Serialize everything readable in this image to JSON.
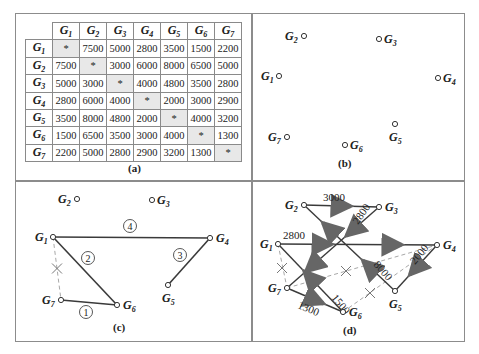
{
  "figure": {
    "panels": {
      "a": {
        "caption": "(a)"
      },
      "b": {
        "caption": "(b)"
      },
      "c": {
        "caption": "(c)"
      },
      "d": {
        "caption": "(d)"
      }
    }
  },
  "matrix": {
    "headers": [
      "G1",
      "G2",
      "G3",
      "G4",
      "G5",
      "G6",
      "G7"
    ],
    "diagonal_symbol": "*",
    "rows": [
      {
        "label": "G1",
        "cells": [
          "*",
          "7500",
          "5000",
          "2800",
          "3500",
          "1500",
          "2200"
        ]
      },
      {
        "label": "G2",
        "cells": [
          "7500",
          "*",
          "3000",
          "6000",
          "8000",
          "6500",
          "5000"
        ]
      },
      {
        "label": "G3",
        "cells": [
          "5000",
          "3000",
          "*",
          "4000",
          "4800",
          "3500",
          "2800"
        ]
      },
      {
        "label": "G4",
        "cells": [
          "2800",
          "6000",
          "4000",
          "*",
          "2000",
          "3000",
          "2900"
        ]
      },
      {
        "label": "G5",
        "cells": [
          "3500",
          "8000",
          "4800",
          "2000",
          "*",
          "4000",
          "3200"
        ]
      },
      {
        "label": "G6",
        "cells": [
          "1500",
          "6500",
          "3500",
          "3000",
          "4000",
          "*",
          "1300"
        ]
      },
      {
        "label": "G7",
        "cells": [
          "2200",
          "5000",
          "2800",
          "2900",
          "3200",
          "1300",
          "*"
        ]
      }
    ]
  },
  "panel_b": {
    "nodes": [
      {
        "id": "G1",
        "x": 279,
        "y": 76,
        "lx": -18,
        "ly": 4
      },
      {
        "id": "G2",
        "x": 304,
        "y": 36,
        "lx": -19,
        "ly": 4
      },
      {
        "id": "G3",
        "x": 379,
        "y": 39,
        "lx": 5,
        "ly": 4
      },
      {
        "id": "G4",
        "x": 438,
        "y": 78,
        "lx": 5,
        "ly": 4
      },
      {
        "id": "G5",
        "x": 395,
        "y": 124,
        "lx": -6,
        "ly": 17
      },
      {
        "id": "G6",
        "x": 345,
        "y": 145,
        "lx": 5,
        "ly": 4
      },
      {
        "id": "G7",
        "x": 287,
        "y": 137,
        "lx": -19,
        "ly": 4
      }
    ]
  },
  "panel_c": {
    "nodes": [
      {
        "id": "G1",
        "x": 53,
        "y": 237,
        "lx": -18,
        "ly": 4
      },
      {
        "id": "G2",
        "x": 77,
        "y": 199,
        "lx": -19,
        "ly": 4
      },
      {
        "id": "G3",
        "x": 152,
        "y": 200,
        "lx": 5,
        "ly": 4
      },
      {
        "id": "G4",
        "x": 210,
        "y": 238,
        "lx": 6,
        "ly": 4
      },
      {
        "id": "G5",
        "x": 168,
        "y": 285,
        "lx": -6,
        "ly": 17
      },
      {
        "id": "G6",
        "x": 117,
        "y": 305,
        "lx": 6,
        "ly": 4
      },
      {
        "id": "G7",
        "x": 61,
        "y": 300,
        "lx": -19,
        "ly": 4
      }
    ],
    "edges": [
      {
        "from": "G7",
        "to": "G6",
        "order": "1"
      },
      {
        "from": "G1",
        "to": "G6",
        "order": "2"
      },
      {
        "from": "G4",
        "to": "G5",
        "order": "3"
      },
      {
        "from": "G1",
        "to": "G4",
        "order": "4"
      }
    ],
    "rejected_edges": [
      {
        "from": "G1",
        "to": "G7"
      }
    ],
    "order_labels": [
      {
        "text": "1",
        "x": 86,
        "y": 312
      },
      {
        "text": "2",
        "x": 88,
        "y": 258
      },
      {
        "text": "3",
        "x": 180,
        "y": 255
      },
      {
        "text": "4",
        "x": 130,
        "y": 226
      }
    ]
  },
  "panel_d": {
    "nodes": [
      {
        "id": "G1",
        "x": 278,
        "y": 244,
        "lx": -18,
        "ly": 4
      },
      {
        "id": "G2",
        "x": 304,
        "y": 205,
        "lx": -19,
        "ly": 4
      },
      {
        "id": "G3",
        "x": 379,
        "y": 207,
        "lx": 6,
        "ly": 4
      },
      {
        "id": "G4",
        "x": 437,
        "y": 245,
        "lx": 6,
        "ly": 4
      },
      {
        "id": "G5",
        "x": 395,
        "y": 291,
        "lx": -6,
        "ly": 17
      },
      {
        "id": "G6",
        "x": 343,
        "y": 312,
        "lx": 6,
        "ly": 4
      },
      {
        "id": "G7",
        "x": 287,
        "y": 288,
        "lx": -19,
        "ly": 4
      }
    ],
    "edges": [
      {
        "from": "G2",
        "to": "G3",
        "label": "3000",
        "lx": 323,
        "ly": 201,
        "rot": 0
      },
      {
        "from": "G1",
        "to": "G4",
        "label": "2800",
        "lx": 283,
        "ly": 239,
        "rot": 0
      },
      {
        "from": "G3",
        "to": "G7",
        "label": "2800",
        "lx": 358,
        "ly": 225,
        "rot": -55
      },
      {
        "from": "G5",
        "to": "G2",
        "label": "8000",
        "lx": 373,
        "ly": 265,
        "rot": 48
      },
      {
        "from": "G4",
        "to": "G5",
        "label": "2000",
        "lx": 415,
        "ly": 265,
        "rot": -50
      },
      {
        "from": "G6",
        "to": "G1",
        "label": "1500",
        "lx": 331,
        "ly": 298,
        "rot": 50
      },
      {
        "from": "G7",
        "to": "G6",
        "label": "1300",
        "lx": 297,
        "ly": 308,
        "rot": 22
      }
    ],
    "rejected_edges": [
      {
        "from": "G1",
        "to": "G7"
      },
      {
        "from": "G7",
        "to": "G4"
      },
      {
        "from": "G6",
        "to": "G4"
      }
    ],
    "crosses": [
      {
        "x": 282,
        "y": 268
      },
      {
        "x": 346,
        "y": 271
      },
      {
        "x": 370,
        "y": 293
      }
    ]
  },
  "colors": {
    "frame": "#8c8c8c",
    "edge": "#3a3a3a",
    "arrow": "#777777",
    "dashed": "#a8a8a8",
    "diag_cell": "#e8e8e8",
    "text": "#222222"
  }
}
